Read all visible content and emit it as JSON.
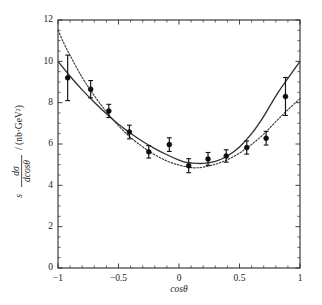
{
  "figure": {
    "title": "",
    "xlabel": "cosθ",
    "ylabel_parts": {
      "s": "s",
      "numerator": "dσ",
      "denominator": "dcosθ",
      "units": "/ (nb·GeV²)"
    },
    "background_color": "#ffffff",
    "foreground_color": "#1a1a1a"
  },
  "axes": {
    "x_ticklabels": [
      "−1",
      "−0.5",
      "0",
      "0.5",
      "1"
    ],
    "x_tickvalues": [
      -1,
      -0.5,
      0,
      0.5,
      1
    ],
    "y_ticklabels": [
      "0",
      "2",
      "4",
      "6",
      "8",
      "10",
      "12"
    ],
    "y_tickvalues": [
      0,
      2,
      4,
      6,
      8,
      10,
      12
    ]
  },
  "chart_data": {
    "type": "scatter",
    "title": "",
    "xlabel": "cosθ",
    "ylabel": "s dσ/dcosθ / (nb·GeV²)",
    "xlim": [
      -1,
      1
    ],
    "ylim": [
      0,
      12
    ],
    "grid": false,
    "legend": "none",
    "x_major_ticks": [
      -1,
      -0.5,
      0,
      0.5,
      1
    ],
    "y_major_ticks": [
      0,
      2,
      4,
      6,
      8,
      10,
      12
    ],
    "x_minor_tick_step": 0.1,
    "y_minor_tick_step": 0.5,
    "series": [
      {
        "name": "data",
        "type": "scatter",
        "marker": "filled-circle",
        "color": "#0d0d0d",
        "points": [
          {
            "x": -0.92,
            "y": 9.2,
            "yerr": 1.1
          },
          {
            "x": -0.73,
            "y": 8.65,
            "yerr": 0.42
          },
          {
            "x": -0.58,
            "y": 7.6,
            "yerr": 0.32
          },
          {
            "x": -0.41,
            "y": 6.58,
            "yerr": 0.33
          },
          {
            "x": -0.25,
            "y": 5.62,
            "yerr": 0.3
          },
          {
            "x": -0.08,
            "y": 5.97,
            "yerr": 0.33
          },
          {
            "x": 0.08,
            "y": 4.95,
            "yerr": 0.34
          },
          {
            "x": 0.24,
            "y": 5.28,
            "yerr": 0.31
          },
          {
            "x": 0.39,
            "y": 5.42,
            "yerr": 0.3
          },
          {
            "x": 0.56,
            "y": 5.83,
            "yerr": 0.32
          },
          {
            "x": 0.72,
            "y": 6.28,
            "yerr": 0.33
          },
          {
            "x": 0.88,
            "y": 8.3,
            "yerr": 0.92
          }
        ]
      },
      {
        "name": "solid-curve",
        "type": "line",
        "style": "solid",
        "color": "#333333",
        "x": [
          -1.0,
          -0.9,
          -0.8,
          -0.7,
          -0.6,
          -0.5,
          -0.4,
          -0.3,
          -0.2,
          -0.1,
          0.0,
          0.05,
          0.1,
          0.2,
          0.3,
          0.4,
          0.5,
          0.6,
          0.7,
          0.8,
          0.9,
          1.0
        ],
        "y": [
          10.0,
          9.28,
          8.62,
          8.02,
          7.46,
          6.96,
          6.52,
          6.12,
          5.78,
          5.48,
          5.22,
          5.12,
          5.08,
          5.06,
          5.16,
          5.42,
          5.86,
          6.5,
          7.34,
          8.32,
          9.18,
          10.0
        ]
      },
      {
        "name": "dotted-curve",
        "type": "line",
        "style": "dotted",
        "color": "#3a3a3a",
        "x": [
          -1.0,
          -0.95,
          -0.9,
          -0.8,
          -0.7,
          -0.6,
          -0.5,
          -0.4,
          -0.3,
          -0.2,
          -0.1,
          0.0,
          0.1,
          0.15,
          0.2,
          0.3,
          0.4,
          0.5,
          0.6,
          0.7,
          0.8,
          0.9,
          1.0
        ],
        "y": [
          11.5,
          10.86,
          10.28,
          9.22,
          8.34,
          7.56,
          6.88,
          6.32,
          5.86,
          5.48,
          5.18,
          4.98,
          4.86,
          4.85,
          4.88,
          5.02,
          5.24,
          5.56,
          5.98,
          6.48,
          7.08,
          7.66,
          8.2
        ]
      }
    ]
  }
}
